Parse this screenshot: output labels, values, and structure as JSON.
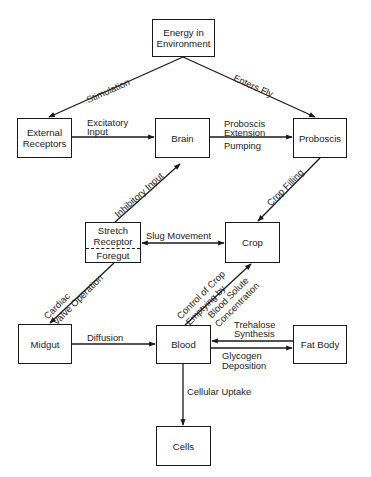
{
  "diagram": {
    "nodes": {
      "energy": {
        "line1": "Energy in",
        "line2": "Environment"
      },
      "external_receptors": {
        "line1": "External",
        "line2": "Receptors"
      },
      "brain": {
        "label": "Brain"
      },
      "proboscis": {
        "label": "Proboscis"
      },
      "stretch_receptor": {
        "top": "Stretch",
        "top2": "Receptor",
        "bottom": "Foregut"
      },
      "crop": {
        "label": "Crop"
      },
      "midgut": {
        "label": "Midgut"
      },
      "blood": {
        "label": "Blood"
      },
      "fat_body": {
        "label": "Fat Body"
      },
      "cells": {
        "label": "Cells"
      }
    },
    "edges": {
      "stimulation": {
        "label": "Stimulation",
        "from": "Energy in Environment",
        "to": "External Receptors"
      },
      "enters_fly": {
        "label": "Enters Fly",
        "from": "Energy in Environment",
        "to": "Proboscis"
      },
      "excitatory_input": {
        "line1": "Excitatory",
        "line2": "Input",
        "from": "External Receptors",
        "to": "Brain"
      },
      "proboscis_extension": {
        "line1": "Proboscis",
        "line2": "Extension",
        "line3": "Pumping",
        "from": "Brain",
        "to": "Proboscis"
      },
      "inhibitory_input": {
        "label": "Inhibitory Input",
        "from": "Stretch Receptor",
        "to": "Brain"
      },
      "crop_filling": {
        "label": "Crop Filling",
        "from": "Proboscis",
        "to": "Crop"
      },
      "slug_movement": {
        "label": "Slug Movement",
        "from": "Stretch Receptor / Foregut",
        "to": "Crop",
        "bidirectional": true
      },
      "cardiac_valve": {
        "line1": "Cardiac",
        "line2": "Valve Operation",
        "from": "Foregut",
        "to": "Midgut"
      },
      "crop_control": {
        "line1": "Control of Crop",
        "line2": "Emptying by",
        "line3": "Blood Solute",
        "line4": "Concentration",
        "from": "Blood",
        "to": "Crop"
      },
      "diffusion": {
        "label": "Diffusion",
        "from": "Midgut",
        "to": "Blood"
      },
      "trehalose": {
        "line1": "Trehalose",
        "line2": "Synthesis",
        "from": "Fat Body",
        "to": "Blood"
      },
      "glycogen": {
        "line1": "Glycogen",
        "line2": "Deposition",
        "from": "Blood",
        "to": "Fat Body"
      },
      "cellular_uptake": {
        "label": "Cellular Uptake",
        "from": "Blood",
        "to": "Cells"
      }
    }
  }
}
